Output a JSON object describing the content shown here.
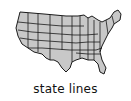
{
  "map": {
    "icon": "us-map-state-lines-icon",
    "fill_color": "#c8c8c8",
    "line_color": "#1a1a1a"
  },
  "caption": "state lines"
}
